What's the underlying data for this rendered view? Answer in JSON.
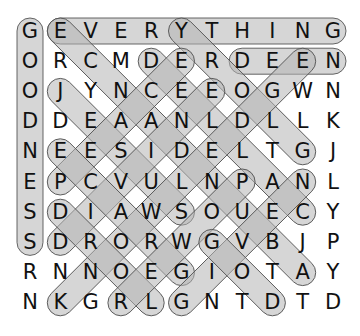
{
  "puzzle": {
    "rows": 10,
    "cols": 11,
    "grid": [
      [
        "G",
        "E",
        "V",
        "E",
        "R",
        "Y",
        "T",
        "H",
        "I",
        "N",
        "G"
      ],
      [
        "O",
        "R",
        "C",
        "M",
        "D",
        "E",
        "R",
        "D",
        "E",
        "E",
        "N"
      ],
      [
        "O",
        "J",
        "Y",
        "N",
        "C",
        "E",
        "E",
        "O",
        "G",
        "W",
        "N"
      ],
      [
        "D",
        "D",
        "E",
        "A",
        "A",
        "N",
        "L",
        "D",
        "L",
        "L",
        "K"
      ],
      [
        "N",
        "E",
        "E",
        "S",
        "I",
        "D",
        "E",
        "L",
        "T",
        "G",
        "J"
      ],
      [
        "E",
        "P",
        "C",
        "V",
        "U",
        "L",
        "N",
        "P",
        "A",
        "N",
        "L"
      ],
      [
        "S",
        "D",
        "I",
        "A",
        "W",
        "S",
        "O",
        "U",
        "E",
        "C",
        "Y"
      ],
      [
        "S",
        "D",
        "R",
        "O",
        "R",
        "W",
        "G",
        "V",
        "B",
        "J",
        "P"
      ],
      [
        "R",
        "N",
        "N",
        "O",
        "E",
        "G",
        "I",
        "O",
        "T",
        "A",
        "Y"
      ],
      [
        "N",
        "K",
        "G",
        "R",
        "L",
        "G",
        "N",
        "T",
        "D",
        "T",
        "D"
      ]
    ],
    "found_words": [
      {
        "word": "GOODNESS",
        "start": [
          0,
          0
        ],
        "end": [
          7,
          0
        ]
      },
      {
        "word": "EVERYTHING",
        "start": [
          0,
          1
        ],
        "end": [
          0,
          10
        ]
      },
      {
        "word": "DEEN",
        "start": [
          1,
          7
        ],
        "end": [
          1,
          10
        ]
      },
      {
        "word": "ABUNDANCE",
        "start": [
          8,
          9
        ],
        "end": [
          0,
          1
        ]
      },
      {
        "word": "GLORY",
        "start": [
          4,
          9
        ],
        "end": [
          0,
          5
        ]
      },
      {
        "word": "JESUS",
        "start": [
          2,
          1
        ],
        "end": [
          6,
          5
        ]
      },
      {
        "word": "CALLED",
        "start": [
          6,
          9
        ],
        "end": [
          1,
          4
        ]
      },
      {
        "word": "PEACE",
        "start": [
          5,
          1
        ],
        "end": [
          1,
          5
        ]
      },
      {
        "word": "KNOWLEDGE",
        "start": [
          9,
          1
        ],
        "end": [
          1,
          9
        ]
      },
      {
        "word": "DIVINE",
        "start": [
          7,
          1
        ],
        "end": [
          2,
          6
        ]
      },
      {
        "word": "GRACE",
        "start": [
          8,
          5
        ],
        "end": [
          4,
          1
        ]
      },
      {
        "word": "LORD",
        "start": [
          9,
          4
        ],
        "end": [
          6,
          1
        ]
      },
      {
        "word": "POWER",
        "start": [
          5,
          7
        ],
        "end": [
          9,
          3
        ]
      },
      {
        "word": "GIVEN",
        "start": [
          9,
          5
        ],
        "end": [
          5,
          9
        ]
      },
      {
        "word": "GOD",
        "start": [
          7,
          6
        ],
        "end": [
          9,
          8
        ]
      }
    ]
  },
  "layout": {
    "origin_x": 30,
    "origin_y": 31,
    "step_x": 30.3,
    "step_y": 30.2,
    "pill_radius": 13
  },
  "colors": {
    "background": "#ffffff",
    "letter": "#111111",
    "pill_fill": "#b4b4b4",
    "pill_fill_opacity": 0.55,
    "pill_stroke": "#555555"
  }
}
